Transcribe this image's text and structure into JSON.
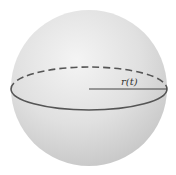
{
  "diagram": {
    "shape": "sphere",
    "radius_label": "r(t)",
    "colors": {
      "background": "#ffffff",
      "sphere_light": "#f2f2f2",
      "sphere_mid": "#d9d9d9",
      "sphere_dark": "#bdbdbd",
      "line": "#555555"
    }
  }
}
